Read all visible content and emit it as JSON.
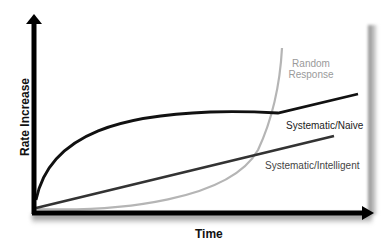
{
  "diagram": {
    "axes": {
      "y_label": "Rate Increase",
      "x_label": "Time"
    },
    "curves": [
      {
        "name": "Random Response",
        "label": "Random Response",
        "color": "#b0b0b0",
        "shape": "exponential"
      },
      {
        "name": "Systematic/Naive",
        "label": "Systematic/Naive",
        "color": "#111111",
        "shape": "logarithmic-then-linear"
      },
      {
        "name": "Systematic/Intelligent",
        "label": "Systematic/Intelligent",
        "color": "#333333",
        "shape": "linear"
      }
    ],
    "labels": {
      "random_line1": "Random",
      "random_line2": "Response",
      "naive": "Systematic/Naive",
      "intelligent": "Systematic/Intelligent"
    }
  }
}
